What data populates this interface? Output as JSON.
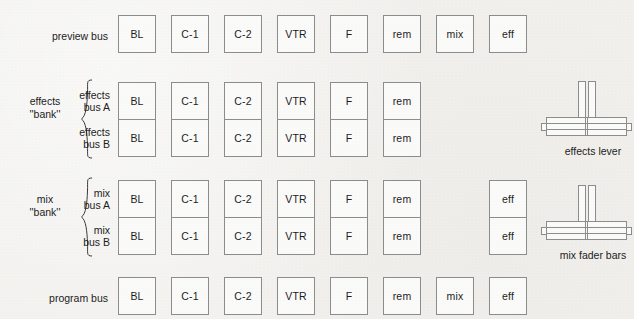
{
  "figure": {
    "background_color": "#f3f2ef",
    "line_color": "#8d8d8d",
    "text_color": "#1d1d1d"
  },
  "columns": [
    {
      "key": "bl",
      "label": "BL",
      "x": 118
    },
    {
      "key": "c1",
      "label": "C-1",
      "x": 171
    },
    {
      "key": "c2",
      "label": "C-2",
      "x": 224
    },
    {
      "key": "vtr",
      "label": "VTR",
      "x": 277
    },
    {
      "key": "f",
      "label": "F",
      "x": 330
    },
    {
      "key": "rem",
      "label": "rem",
      "x": 383
    },
    {
      "key": "mix",
      "label": "mix",
      "x": 436
    },
    {
      "key": "eff",
      "label": "eff",
      "x": 489
    }
  ],
  "rows": [
    {
      "name": "preview-bus",
      "label": "preview bus",
      "y": 15,
      "buttons": [
        "BL",
        "C-1",
        "C-2",
        "VTR",
        "F",
        "rem",
        "mix",
        "eff"
      ],
      "columns": [
        "bl",
        "c1",
        "c2",
        "vtr",
        "f",
        "rem",
        "mix",
        "eff"
      ]
    },
    {
      "name": "effects-bus-a",
      "label": "effects\nbus A",
      "y": 82,
      "buttons": [
        "BL",
        "C-1",
        "C-2",
        "VTR",
        "F",
        "rem"
      ],
      "columns": [
        "bl",
        "c1",
        "c2",
        "vtr",
        "f",
        "rem"
      ]
    },
    {
      "name": "effects-bus-b",
      "label": "effects\nbus B",
      "y": 119,
      "buttons": [
        "BL",
        "C-1",
        "C-2",
        "VTR",
        "F",
        "rem"
      ],
      "columns": [
        "bl",
        "c1",
        "c2",
        "vtr",
        "f",
        "rem"
      ]
    },
    {
      "name": "mix-bus-a",
      "label": "mix\nbus A",
      "y": 180,
      "buttons": [
        "BL",
        "C-1",
        "C-2",
        "VTR",
        "F",
        "rem",
        "eff"
      ],
      "columns": [
        "bl",
        "c1",
        "c2",
        "vtr",
        "f",
        "rem",
        "eff"
      ]
    },
    {
      "name": "mix-bus-b",
      "label": "mix\nbus B",
      "y": 217,
      "buttons": [
        "BL",
        "C-1",
        "C-2",
        "VTR",
        "F",
        "rem",
        "eff"
      ],
      "columns": [
        "bl",
        "c1",
        "c2",
        "vtr",
        "f",
        "rem",
        "eff"
      ]
    },
    {
      "name": "program-bus",
      "label": "program bus",
      "y": 277,
      "buttons": [
        "BL",
        "C-1",
        "C-2",
        "VTR",
        "F",
        "rem",
        "mix",
        "eff"
      ],
      "columns": [
        "bl",
        "c1",
        "c2",
        "vtr",
        "f",
        "rem",
        "mix",
        "eff"
      ]
    }
  ],
  "banks": [
    {
      "name": "effects-bank",
      "label": "effects\n''bank''",
      "x": 14,
      "y": 95
    },
    {
      "name": "mix-bank",
      "label": "mix\n''bank''",
      "x": 14,
      "y": 193
    }
  ],
  "levers": [
    {
      "name": "effects-lever",
      "caption": "effects lever",
      "x": 548,
      "y": 82
    },
    {
      "name": "mix-fader-bars",
      "caption": "mix fader bars",
      "x": 548,
      "y": 186
    }
  ]
}
